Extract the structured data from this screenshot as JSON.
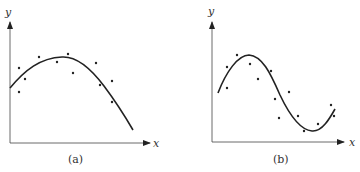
{
  "panels": [
    {
      "id": "a",
      "caption": "(a)",
      "x_label": "x",
      "y_label": "y",
      "description": "Data points with a quadratic-like fitted curve (single peak)",
      "curve_path": "M10,88 C25,70 40,58 62,57 C78,56 92,70 104,86 C116,102 126,118 133,130",
      "points": [
        [
          19,
          68
        ],
        [
          19,
          92
        ],
        [
          25,
          79
        ],
        [
          39,
          57
        ],
        [
          57,
          62
        ],
        [
          68,
          54
        ],
        [
          73,
          73
        ],
        [
          96,
          63
        ],
        [
          100,
          85
        ],
        [
          112,
          81
        ],
        [
          112,
          102
        ]
      ]
    },
    {
      "id": "b",
      "caption": "(b)",
      "x_label": "x",
      "y_label": "y",
      "description": "Data points with a cubic/sinusoidal-like fitted curve (peak then trough)",
      "curve_path": "M218,93 C226,72 238,55 249,55 C262,56 270,72 280,95 C290,116 300,130 312,131 C322,132 330,118 335,109",
      "points": [
        [
          227,
          67
        ],
        [
          227,
          88
        ],
        [
          237,
          55
        ],
        [
          250,
          64
        ],
        [
          258,
          79
        ],
        [
          271,
          71
        ],
        [
          275,
          99
        ],
        [
          279,
          118
        ],
        [
          289,
          92
        ],
        [
          298,
          116
        ],
        [
          304,
          131
        ],
        [
          318,
          124
        ],
        [
          331,
          105
        ],
        [
          334,
          116
        ]
      ]
    }
  ],
  "chart_data": [
    {
      "type": "scatter",
      "title": "(a)",
      "xlabel": "x",
      "ylabel": "y",
      "fit": "quadratic (concave down)",
      "grid": false,
      "points_approx": [
        [
          1,
          3.0
        ],
        [
          1,
          1.9
        ],
        [
          1.6,
          2.5
        ],
        [
          3,
          3.4
        ],
        [
          4.7,
          3.2
        ],
        [
          5.8,
          3.5
        ],
        [
          6.3,
          2.8
        ],
        [
          8.6,
          3.2
        ],
        [
          9,
          2.2
        ],
        [
          10.2,
          2.4
        ],
        [
          10.2,
          1.5
        ]
      ]
    },
    {
      "type": "scatter",
      "title": "(b)",
      "xlabel": "x",
      "ylabel": "y",
      "fit": "cubic (peak then trough)",
      "grid": false,
      "points_approx": [
        [
          1.5,
          3.1
        ],
        [
          1.5,
          2.2
        ],
        [
          2.5,
          3.6
        ],
        [
          3.8,
          3.2
        ],
        [
          4.6,
          2.6
        ],
        [
          5.9,
          2.9
        ],
        [
          6.3,
          1.7
        ],
        [
          6.7,
          0.95
        ],
        [
          7.7,
          2.1
        ],
        [
          8.6,
          1.1
        ],
        [
          9.2,
          0.45
        ],
        [
          10.6,
          0.75
        ],
        [
          11.9,
          1.5
        ],
        [
          12.2,
          1.1
        ]
      ]
    }
  ]
}
